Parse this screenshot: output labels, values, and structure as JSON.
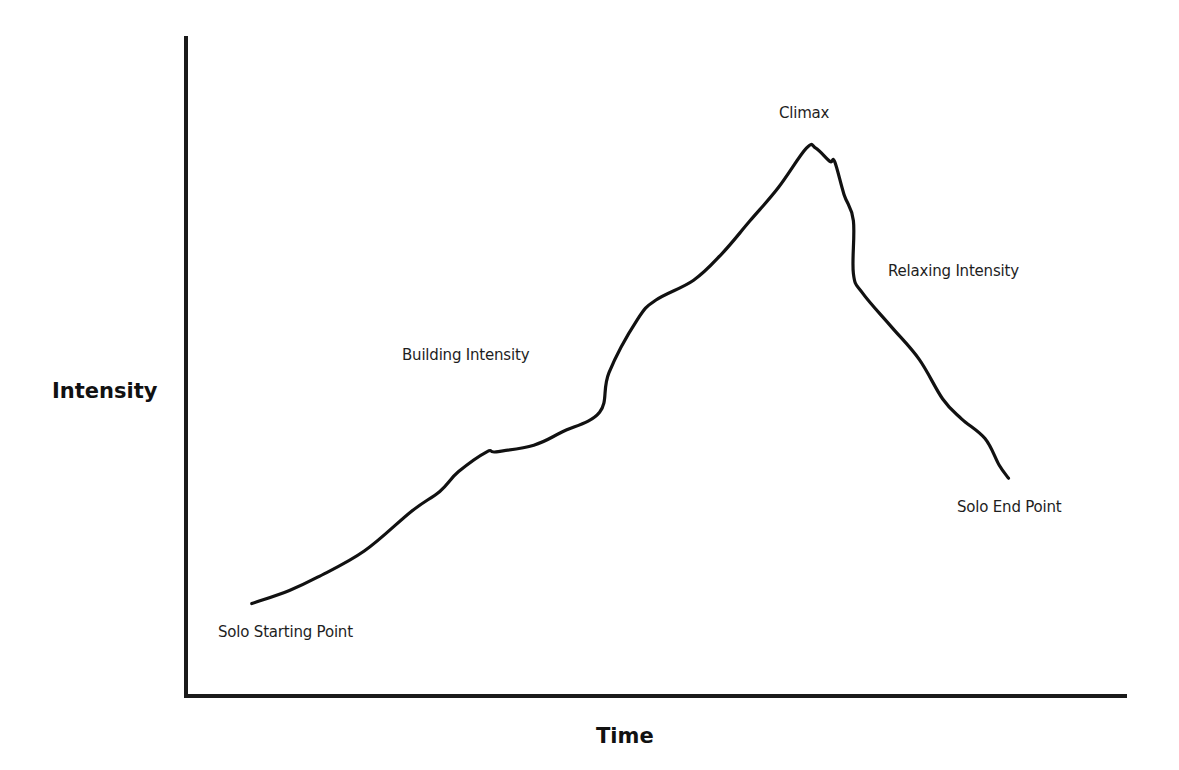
{
  "chart_data": {
    "type": "line",
    "title": "",
    "xlabel": "Time",
    "ylabel": "Intensity",
    "grid": false,
    "legend": null,
    "axis_ticks": "none",
    "xlim": [
      0,
      100
    ],
    "ylim": [
      0,
      100
    ],
    "colors": {
      "line": "#111111",
      "axes": "#1a1a1a",
      "text": "#1e1e1e",
      "background": "#ffffff"
    },
    "series": [
      {
        "name": "Solo Intensity Curve",
        "x": [
          7,
          11,
          14,
          19,
          24,
          27,
          29,
          32,
          33,
          37,
          40,
          44,
          45,
          48,
          50,
          54,
          57,
          60,
          63,
          66,
          67,
          68.5,
          69,
          70,
          71,
          71,
          72,
          75,
          78,
          80.5,
          82.5,
          85,
          86.5,
          87.5
        ],
        "y": [
          14,
          16,
          18,
          22,
          28,
          31,
          34,
          37,
          37,
          38,
          40,
          43,
          49,
          57,
          60,
          63,
          67,
          72,
          77,
          83,
          83,
          81,
          81,
          76,
          72,
          64,
          61,
          56,
          51,
          45,
          42,
          39,
          35,
          33
        ]
      }
    ],
    "annotations": [
      {
        "id": "start",
        "text": "Solo Starting Point",
        "x": 7,
        "y": 14
      },
      {
        "id": "building",
        "text": "Building Intensity",
        "x": 30,
        "y": 52
      },
      {
        "id": "climax",
        "text": "Climax",
        "x": 67,
        "y": 83
      },
      {
        "id": "relaxing",
        "text": "Relaxing Intensity",
        "x": 75,
        "y": 64
      },
      {
        "id": "end",
        "text": "Solo End Point",
        "x": 87.5,
        "y": 33
      }
    ]
  },
  "labels": {
    "x_axis": "Time",
    "y_axis": "Intensity",
    "start": "Solo Starting Point",
    "building": "Building Intensity",
    "climax": "Climax",
    "relaxing": "Relaxing Intensity",
    "end": "Solo End Point"
  }
}
